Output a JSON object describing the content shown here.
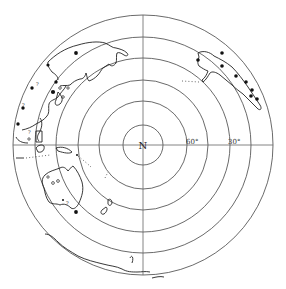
{
  "map": {
    "title": "Polar projection (South Pole centered) with earthquake/site markers",
    "center_label": "N",
    "latitude_labels": [
      "60°",
      "30°"
    ],
    "rings": 6,
    "regions": [
      "South America",
      "Antarctica",
      "Australia",
      "New Zealand",
      "Africa"
    ],
    "colors": {
      "line": "#444444",
      "marker": "#111111",
      "background": "#ffffff"
    }
  }
}
